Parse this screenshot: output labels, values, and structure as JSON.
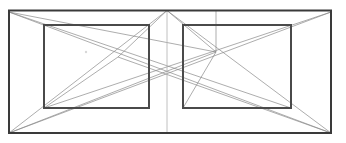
{
  "figure": {
    "background_color": "#ffffff",
    "width": 346,
    "height": 143
  },
  "style": {
    "outer_stroke": "#3a3a3a",
    "inner_stroke": "#4a4a4a",
    "construction_stroke": "#8a8a8a",
    "axis_stroke": "#b0b0b0",
    "outer_stroke_width": 2,
    "inner_stroke_width": 2,
    "construction_stroke_width": 0.7
  },
  "shapes": {
    "outer_frame": {
      "x": 9,
      "y": 10.5,
      "width": 322,
      "height": 122.5
    },
    "left_panel": {
      "x": 44,
      "y": 25,
      "width": 105,
      "height": 83
    },
    "right_panel": {
      "x": 183,
      "y": 25,
      "width": 108,
      "height": 83
    }
  },
  "points": {
    "outer_top_left": {
      "x": 9,
      "y": 10.5
    },
    "outer_top_right": {
      "x": 331,
      "y": 10.5
    },
    "outer_bottom_left": {
      "x": 9,
      "y": 133
    },
    "outer_bottom_right": {
      "x": 331,
      "y": 133
    },
    "left_panel_top_left": {
      "x": 44,
      "y": 25
    },
    "left_panel_top_right": {
      "x": 149,
      "y": 25
    },
    "left_panel_bottom_left": {
      "x": 44,
      "y": 108
    },
    "left_panel_bottom_right": {
      "x": 149,
      "y": 108
    },
    "right_panel_top_left": {
      "x": 183,
      "y": 25
    },
    "right_panel_top_right": {
      "x": 291,
      "y": 25
    },
    "right_panel_bottom_left": {
      "x": 183,
      "y": 108
    },
    "right_panel_bottom_right": {
      "x": 291,
      "y": 108
    },
    "apex_top_center": {
      "x": 167,
      "y": 10.5
    },
    "crossing_center": {
      "x": 167,
      "y": 75
    },
    "left_vanish_node": {
      "x": 118,
      "y": 57
    },
    "right_vanish_node": {
      "x": 216,
      "y": 52
    },
    "stub_vertical_top": {
      "x": 216,
      "y": 10.5
    },
    "stub_vertical_bottom": {
      "x": 216,
      "y": 52
    },
    "speck": {
      "x": 86,
      "y": 52
    }
  },
  "lines": {
    "center_axis": {
      "x1": 167,
      "y1": 10.5,
      "x2": 167,
      "y2": 133
    },
    "stub_vertical": {
      "x1": 216,
      "y1": 10.5,
      "x2": 216,
      "y2": 52
    },
    "construction": [
      {
        "name": "outer-tl-to-center-cross",
        "x1": 9,
        "y1": 12,
        "x2": 216,
        "y2": 52
      },
      {
        "name": "outer-tl-to-right-panel-br",
        "x1": 9,
        "y1": 12,
        "x2": 291,
        "y2": 108
      },
      {
        "name": "outer-bl-to-apex",
        "x1": 9,
        "y1": 133,
        "x2": 167,
        "y2": 10.5
      },
      {
        "name": "outer-bl-to-right-panel-tl-node",
        "x1": 9,
        "y1": 133,
        "x2": 216,
        "y2": 52
      },
      {
        "name": "outer-bl-to-outer-tr",
        "x1": 9,
        "y1": 133,
        "x2": 331,
        "y2": 12
      },
      {
        "name": "outer-tr-to-left-panel-bl",
        "x1": 331,
        "y1": 12,
        "x2": 44,
        "y2": 108
      },
      {
        "name": "outer-br-to-apex",
        "x1": 331,
        "y1": 133,
        "x2": 167,
        "y2": 10.5
      },
      {
        "name": "outer-br-to-left-node",
        "x1": 331,
        "y1": 133,
        "x2": 118,
        "y2": 57
      },
      {
        "name": "outer-br-to-outer-tl",
        "x1": 331,
        "y1": 133,
        "x2": 9,
        "y2": 12
      },
      {
        "name": "left-node-to-left-panel-bl",
        "x1": 118,
        "y1": 57,
        "x2": 44,
        "y2": 108
      },
      {
        "name": "right-node-to-right-panel-bl",
        "x1": 216,
        "y1": 52,
        "x2": 183,
        "y2": 108
      },
      {
        "name": "apex-to-left-node",
        "x1": 167,
        "y1": 10.5,
        "x2": 118,
        "y2": 57
      },
      {
        "name": "apex-to-right-node",
        "x1": 167,
        "y1": 10.5,
        "x2": 216,
        "y2": 52
      }
    ]
  }
}
